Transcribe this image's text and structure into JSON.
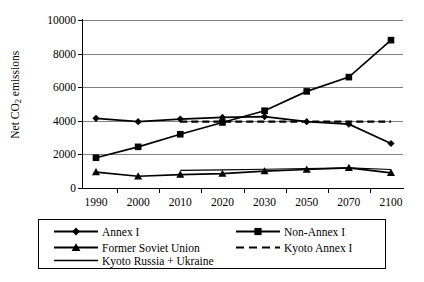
{
  "chart_data": {
    "type": "line",
    "title": "",
    "xlabel": "",
    "ylabel": "Net CO2 emissions",
    "ylabel_prefix": "Net CO",
    "ylabel_sub": "2",
    "ylabel_suffix": " emissions",
    "categories": [
      "1990",
      "2000",
      "2010",
      "2020",
      "2030",
      "2050",
      "2070",
      "2100"
    ],
    "ylim": [
      0,
      10000
    ],
    "yticks": [
      0,
      2000,
      4000,
      6000,
      8000,
      10000
    ],
    "ytick_labels": [
      "0",
      "2000",
      "4000",
      "6000",
      "8000",
      "10000"
    ],
    "grid": true,
    "legend_position": "bottom",
    "series": [
      {
        "name": "Annex I",
        "marker": "diamond",
        "line": "solid",
        "color": "#000000",
        "values": [
          4150,
          3950,
          4100,
          4200,
          4250,
          3950,
          3800,
          2650
        ]
      },
      {
        "name": "Non-Annex I",
        "marker": "square",
        "line": "solid",
        "color": "#000000",
        "values": [
          1800,
          2450,
          3200,
          3900,
          4600,
          5750,
          6600,
          8800
        ]
      },
      {
        "name": "Former Soviet Union",
        "marker": "triangle",
        "line": "solid",
        "color": "#000000",
        "values": [
          950,
          700,
          800,
          850,
          1000,
          1100,
          1200,
          900
        ]
      },
      {
        "name": "Kyoto Annex I",
        "marker": "none",
        "line": "dashed",
        "color": "#000000",
        "values": [
          null,
          null,
          3950,
          3950,
          3950,
          3950,
          3950,
          3950
        ]
      },
      {
        "name": "Kyoto Russia + Ukraine",
        "marker": "none",
        "line": "solid-thin",
        "color": "#000000",
        "values": [
          null,
          null,
          1050,
          1080,
          1120,
          1160,
          1200,
          1100
        ]
      }
    ]
  },
  "legend": {
    "items": [
      {
        "label": "Annex I",
        "sample": "line-diamond"
      },
      {
        "label": "Non-Annex I",
        "sample": "line-square"
      },
      {
        "label": "Former Soviet Union",
        "sample": "line-triangle"
      },
      {
        "label": "Kyoto Annex I",
        "sample": "line-dashed"
      },
      {
        "label": "Kyoto Russia + Ukraine",
        "sample": "line-plain"
      }
    ]
  }
}
